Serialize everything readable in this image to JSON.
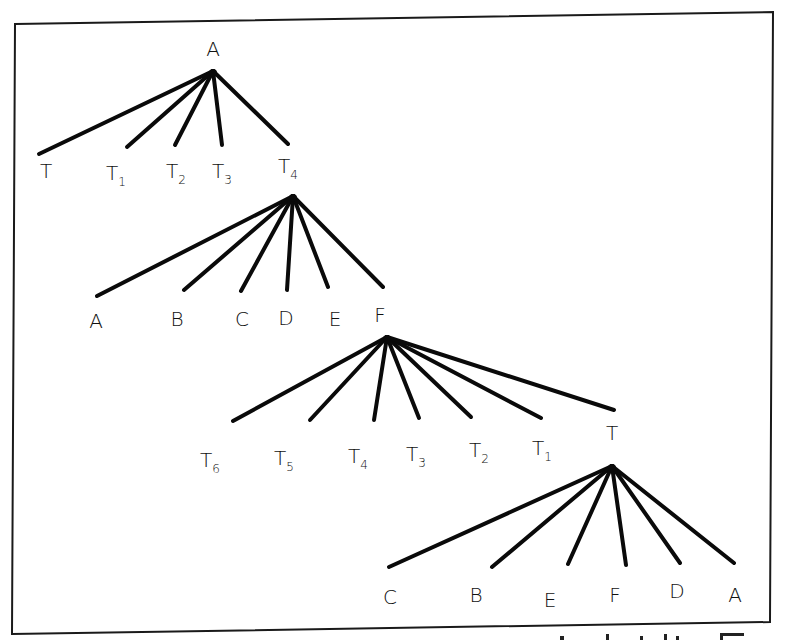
{
  "figure": {
    "trees": [
      {
        "root": {
          "label": "A",
          "x": 213,
          "y": 71,
          "label_x": 213,
          "label_y": 56
        },
        "children": [
          {
            "label": "T",
            "sub": "",
            "end": [
              39,
              154
            ],
            "lx": 46,
            "ly": 178
          },
          {
            "label": "T",
            "sub": "1",
            "end": [
              127,
              147
            ],
            "lx": 116,
            "ly": 180
          },
          {
            "label": "T",
            "sub": "2",
            "end": [
              175,
              145
            ],
            "lx": 176,
            "ly": 178
          },
          {
            "label": "T",
            "sub": "3",
            "end": [
              222,
              145
            ],
            "lx": 222,
            "ly": 178
          },
          {
            "label": "T",
            "sub": "4",
            "end": [
              288,
              144
            ],
            "lx": 288,
            "ly": 173
          }
        ]
      },
      {
        "root": {
          "label": "",
          "x": 293,
          "y": 196
        },
        "children": [
          {
            "label": "A",
            "sub": "",
            "end": [
              97,
              296
            ],
            "lx": 96,
            "ly": 328
          },
          {
            "label": "B",
            "sub": "",
            "end": [
              184,
              290
            ],
            "lx": 177,
            "ly": 326
          },
          {
            "label": "C",
            "sub": "",
            "end": [
              241,
              291
            ],
            "lx": 242,
            "ly": 326
          },
          {
            "label": "D",
            "sub": "",
            "end": [
              287,
              290
            ],
            "lx": 286,
            "ly": 325
          },
          {
            "label": "E",
            "sub": "",
            "end": [
              328,
              287
            ],
            "lx": 335,
            "ly": 326
          },
          {
            "label": "F",
            "sub": "",
            "end": [
              383,
              287
            ],
            "lx": 380,
            "ly": 322
          }
        ]
      },
      {
        "root": {
          "label": "",
          "x": 387,
          "y": 337
        },
        "children": [
          {
            "label": "T",
            "sub": "6",
            "end": [
              233,
              421
            ],
            "lx": 210,
            "ly": 467
          },
          {
            "label": "T",
            "sub": "5",
            "end": [
              310,
              420
            ],
            "lx": 284,
            "ly": 465
          },
          {
            "label": "T",
            "sub": "4",
            "end": [
              374,
              420
            ],
            "lx": 358,
            "ly": 463
          },
          {
            "label": "T",
            "sub": "3",
            "end": [
              419,
              418
            ],
            "lx": 416,
            "ly": 461
          },
          {
            "label": "T",
            "sub": "2",
            "end": [
              471,
              417
            ],
            "lx": 479,
            "ly": 457
          },
          {
            "label": "T",
            "sub": "1",
            "end": [
              541,
              418
            ],
            "lx": 542,
            "ly": 455
          },
          {
            "label": "T",
            "sub": "",
            "end": [
              614,
              410
            ],
            "lx": 612,
            "ly": 440
          }
        ]
      },
      {
        "root": {
          "label": "",
          "x": 612,
          "y": 466
        },
        "children": [
          {
            "label": "C",
            "sub": "",
            "end": [
              389,
              567
            ],
            "lx": 390,
            "ly": 604
          },
          {
            "label": "B",
            "sub": "",
            "end": [
              492,
              567
            ],
            "lx": 476,
            "ly": 602
          },
          {
            "label": "E",
            "sub": "",
            "end": [
              568,
              564
            ],
            "lx": 550,
            "ly": 607
          },
          {
            "label": "F",
            "sub": "",
            "end": [
              626,
              565
            ],
            "lx": 615,
            "ly": 602
          },
          {
            "label": "D",
            "sub": "",
            "end": [
              680,
              563
            ],
            "lx": 677,
            "ly": 598
          },
          {
            "label": "A",
            "sub": "",
            "end": [
              734,
              563
            ],
            "lx": 735,
            "ly": 602
          }
        ]
      }
    ],
    "frame": {
      "points": "15,24 773,12 770,622 12,634"
    },
    "colors": {
      "line": "#0a0a0a",
      "background": "#ffffff"
    }
  }
}
